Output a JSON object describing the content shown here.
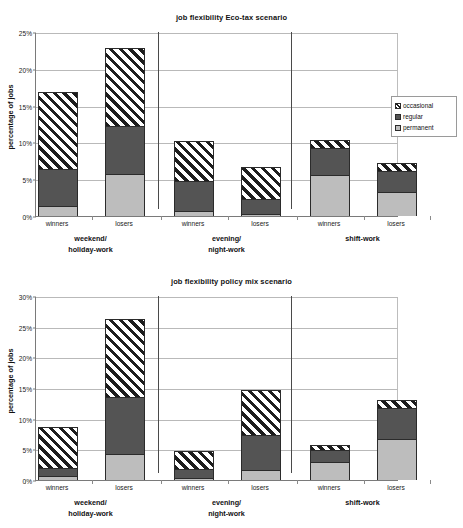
{
  "chart_data": [
    {
      "id": "eco-tax",
      "type": "bar",
      "stacked": true,
      "title": "job flexibility Eco-tax scenario",
      "xlabel": "",
      "ylabel": "percentage of jobs",
      "ylim": [
        0,
        25
      ],
      "ytick_step": 5,
      "ytick_labels": [
        "0%",
        "5%",
        "10%",
        "15%",
        "20%",
        "25%"
      ],
      "ytick_values": [
        0,
        5,
        10,
        15,
        20,
        25
      ],
      "grid": true,
      "legend_position": "right",
      "series": [
        {
          "name": "permanent",
          "color": "#bdbdbd",
          "values": [
            1.4,
            5.7,
            0.7,
            0.3,
            5.6,
            3.2
          ]
        },
        {
          "name": "regular",
          "color": "#545454",
          "values": [
            5.0,
            6.6,
            4.0,
            2.0,
            3.7,
            2.9
          ]
        },
        {
          "name": "occasional",
          "color": "#ffffff",
          "pattern": "diagonal-hatch",
          "values": [
            10.4,
            10.5,
            5.5,
            4.4,
            1.0,
            1.1
          ]
        }
      ],
      "cumulative_tops": [
        {
          "permanent": 1.4,
          "regular": 6.4,
          "occasional": 16.8
        },
        {
          "permanent": 5.7,
          "regular": 12.3,
          "occasional": 22.8
        },
        {
          "permanent": 0.7,
          "regular": 4.7,
          "occasional": 10.2
        },
        {
          "permanent": 0.3,
          "regular": 2.3,
          "occasional": 6.7
        },
        {
          "permanent": 5.6,
          "regular": 9.3,
          "occasional": 10.3
        },
        {
          "permanent": 3.2,
          "regular": 6.1,
          "occasional": 7.2
        }
      ],
      "categories": [
        "winners",
        "losers",
        "winners",
        "losers",
        "winners",
        "losers"
      ],
      "groups": [
        {
          "label_line1": "weekend/",
          "label_line2": "holiday-work"
        },
        {
          "label_line1": "evening/",
          "label_line2": "night-work"
        },
        {
          "label_line1": "shift-work",
          "label_line2": ""
        }
      ],
      "legend": [
        {
          "label": "occasional",
          "swatch": "hatch-swatch"
        },
        {
          "label": "regular",
          "swatch": "dark-gray-swatch"
        },
        {
          "label": "permanent",
          "swatch": "light-gray-swatch"
        }
      ]
    },
    {
      "id": "policy-mix",
      "type": "bar",
      "stacked": true,
      "title": "job flexibility policy mix scenario",
      "xlabel": "",
      "ylabel": "percentage of jobs",
      "ylim": [
        0,
        30
      ],
      "ytick_step": 5,
      "ytick_labels": [
        "0%",
        "5%",
        "10%",
        "15%",
        "20%",
        "25%",
        "30%"
      ],
      "ytick_values": [
        0,
        5,
        10,
        15,
        20,
        25,
        30
      ],
      "grid": true,
      "legend_position": "right",
      "series": [
        {
          "name": "permanent",
          "color": "#bdbdbd",
          "values": [
            0.6,
            4.3,
            0.4,
            1.7,
            2.9,
            6.7
          ]
        },
        {
          "name": "regular",
          "color": "#545454",
          "values": [
            1.3,
            9.3,
            1.4,
            5.6,
            2.0,
            5.0
          ]
        },
        {
          "name": "occasional",
          "color": "#ffffff",
          "pattern": "diagonal-hatch",
          "values": [
            6.8,
            12.6,
            2.9,
            7.3,
            0.8,
            1.4
          ]
        }
      ],
      "cumulative_tops": [
        {
          "permanent": 0.6,
          "regular": 1.9,
          "occasional": 8.7
        },
        {
          "permanent": 4.3,
          "regular": 13.6,
          "occasional": 26.2
        },
        {
          "permanent": 0.4,
          "regular": 1.8,
          "occasional": 4.7
        },
        {
          "permanent": 1.7,
          "regular": 7.3,
          "occasional": 14.6
        },
        {
          "permanent": 2.9,
          "regular": 4.9,
          "occasional": 5.7
        },
        {
          "permanent": 6.7,
          "regular": 11.7,
          "occasional": 13.1
        }
      ],
      "categories": [
        "winners",
        "losers",
        "winners",
        "losers",
        "winners",
        "losers"
      ],
      "groups": [
        {
          "label_line1": "weekend/",
          "label_line2": "holiday-work"
        },
        {
          "label_line1": "evening/",
          "label_line2": "night-work"
        },
        {
          "label_line1": "shift-work",
          "label_line2": ""
        }
      ],
      "legend": [
        {
          "label": "occasional",
          "swatch": "hatch-swatch"
        },
        {
          "label": "regular",
          "swatch": "dark-gray-swatch"
        },
        {
          "label": "permanent",
          "swatch": "light-gray-swatch"
        }
      ]
    }
  ],
  "colors": {
    "permanent": "#bdbdbd",
    "regular": "#545454",
    "occasional": "#ffffff",
    "axis": "#7a7a7a",
    "grid": "#b9b9b9",
    "text": "#111111"
  }
}
